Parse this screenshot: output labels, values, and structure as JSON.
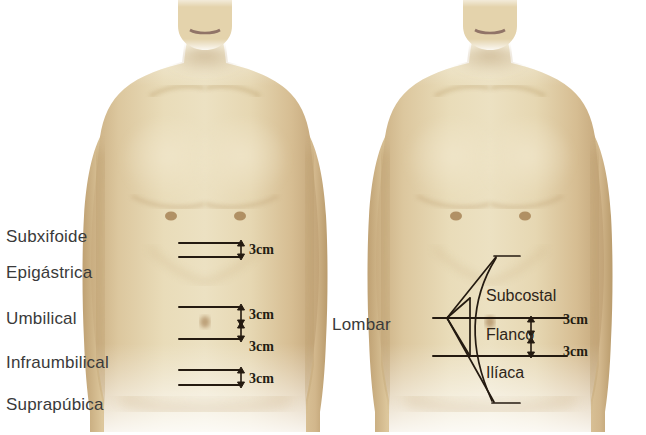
{
  "figure": {
    "background_color": "#ffffff",
    "skin_base_color": "#ddcba5",
    "skin_shadow_color": "#c4a87a",
    "skin_highlight_color": "#eee1c4",
    "line_color": "#241a10",
    "text_color": "#3a3a3a"
  },
  "left_panel": {
    "region_labels": [
      {
        "text": "Subxifoide",
        "y": 228
      },
      {
        "text": "Epigástrica",
        "y": 264
      },
      {
        "text": "Umbilical",
        "y": 310
      },
      {
        "text": "Infraumbilical",
        "y": 354
      },
      {
        "text": "Suprapúbica",
        "y": 396
      }
    ],
    "rule_lines": [
      {
        "y": 243,
        "x": 178,
        "w": 62
      },
      {
        "y": 257,
        "x": 178,
        "w": 62
      },
      {
        "y": 307,
        "x": 178,
        "w": 62
      },
      {
        "y": 339,
        "x": 178,
        "w": 62
      },
      {
        "y": 370,
        "x": 178,
        "w": 62
      },
      {
        "y": 385,
        "x": 178,
        "w": 62
      }
    ],
    "dimensions": [
      {
        "text": "3cm",
        "x": 248,
        "y": 244,
        "arrow_top": 241,
        "arrow_bottom": 258
      },
      {
        "text": "3cm",
        "x": 248,
        "y": 309,
        "arrow_top": 305,
        "arrow_bottom": 323
      },
      {
        "text": "3cm",
        "x": 248,
        "y": 341,
        "arrow_top": 324,
        "arrow_bottom": 341
      },
      {
        "text": "3cm",
        "x": 248,
        "y": 373,
        "arrow_top": 369,
        "arrow_bottom": 387
      }
    ]
  },
  "middle_panel": {
    "lombar_label": {
      "text": "Lombar",
      "x": 332,
      "y": 316
    }
  },
  "right_panel": {
    "region_labels": [
      {
        "text": "Subcostal",
        "x": 486,
        "y": 288
      },
      {
        "text": "Flanco",
        "x": 486,
        "y": 327
      },
      {
        "text": "Ilíaca",
        "x": 486,
        "y": 365
      }
    ],
    "rule_lines": [
      {
        "y": 318,
        "x": 432,
        "w": 136
      },
      {
        "y": 356,
        "x": 432,
        "w": 136
      }
    ],
    "dimensions": [
      {
        "text": "3cm",
        "x": 568,
        "y": 313
      },
      {
        "text": "3cm",
        "x": 568,
        "y": 345
      }
    ],
    "bracket": {
      "description": "curved pointer bracket indicating lateral abdominal wall",
      "apex_x": 446,
      "top_y": 256,
      "bottom_y": 404
    }
  },
  "icons": {
    "double_arrow": "double-headed-vertical-arrow"
  }
}
